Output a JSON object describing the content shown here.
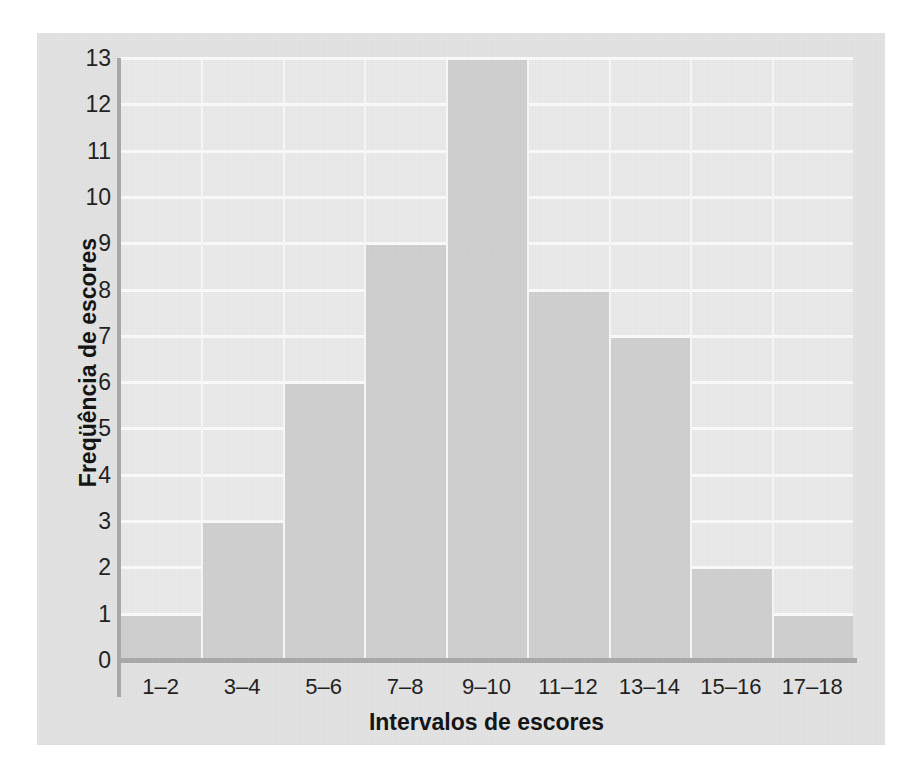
{
  "chart_data": {
    "type": "bar",
    "title": "",
    "subtitle": "",
    "xlabel": "Intervalos de escores",
    "ylabel": "Freqüência de escores",
    "categories": [
      "1–2",
      "3–4",
      "5–6",
      "7–8",
      "9–10",
      "11–12",
      "13–14",
      "15–16",
      "17–18"
    ],
    "values": [
      1,
      3,
      6,
      9,
      13,
      8,
      7,
      2,
      1
    ],
    "ylim": [
      0,
      13
    ],
    "ytick_labels": [
      "0",
      "1",
      "2",
      "3",
      "4",
      "5",
      "6",
      "7",
      "8",
      "9",
      "10",
      "11",
      "12",
      "13"
    ],
    "ytick_values": [
      0,
      1,
      2,
      3,
      4,
      5,
      6,
      7,
      8,
      9,
      10,
      11,
      12,
      13
    ],
    "grid": true,
    "grid_axis": "y",
    "legend": false,
    "legend_position": "none",
    "bar_color": "#cfcfcf",
    "plot_background": "#eaeaea",
    "panel_background": "#e3e3e3",
    "gridline_color": "#fbfbfb",
    "axis_color": "#a9a9a9",
    "text_color": "#1d1d1d"
  }
}
